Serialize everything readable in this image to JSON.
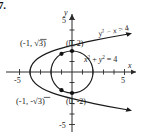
{
  "problem": {
    "number": "7."
  },
  "figure": {
    "axes": {
      "x_axis_label": "x",
      "y_axis_label": "y",
      "x_ticks": [
        {
          "value": -5,
          "label": "-5"
        },
        {
          "value": -4,
          "label": ""
        },
        {
          "value": -3,
          "label": ""
        },
        {
          "value": -2,
          "label": ""
        },
        {
          "value": -1,
          "label": ""
        },
        {
          "value": 1,
          "label": ""
        },
        {
          "value": 2,
          "label": ""
        },
        {
          "value": 3,
          "label": ""
        },
        {
          "value": 4,
          "label": ""
        },
        {
          "value": 5,
          "label": "5"
        }
      ],
      "y_ticks": [
        {
          "value": 5,
          "label": "5"
        },
        {
          "value": 4,
          "label": ""
        },
        {
          "value": 3,
          "label": ""
        },
        {
          "value": 2,
          "label": ""
        },
        {
          "value": 1,
          "label": ""
        },
        {
          "value": -1,
          "label": ""
        },
        {
          "value": -2,
          "label": ""
        },
        {
          "value": -3,
          "label": ""
        },
        {
          "value": -4,
          "label": ""
        },
        {
          "value": -5,
          "label": "-5"
        }
      ],
      "xlim": [
        -6,
        6
      ],
      "ylim": [
        -6,
        6
      ]
    },
    "curves": [
      {
        "name": "parabola",
        "equation_parts": {
          "base1": "y",
          "exp1": "2",
          "mid": " − ",
          "base2": "x",
          "tail": " = 4"
        },
        "equation_text": "y² − x = 4",
        "vertex": [
          -4,
          0
        ],
        "opens": "right",
        "arrowheads": 2
      },
      {
        "name": "circle",
        "equation_parts": {
          "base1": "x",
          "exp1": "2",
          "mid": " + ",
          "base2": "y",
          "exp2": "2",
          "tail": " = 4"
        },
        "equation_text": "x² + y² = 4",
        "center": [
          0,
          0
        ],
        "radius": 2
      }
    ],
    "points": [
      {
        "name": "upper-intersection",
        "label": "(-1, √3)",
        "x": -1,
        "y": 1.732,
        "marked": true
      },
      {
        "name": "lower-intersection",
        "label": "(-1, -√3)",
        "x": -1,
        "y": -1.732,
        "marked": true
      },
      {
        "name": "top-point",
        "label": "(0, 2)",
        "x": 0,
        "y": 2,
        "marked": true
      },
      {
        "name": "bottom-point",
        "label": "(0, -2)",
        "x": 0,
        "y": -2,
        "marked": true
      }
    ],
    "point_label_parts": {
      "upper": {
        "open": "(",
        "x": "-1, ",
        "radical": "√",
        "radicand": "3",
        "close": ")"
      },
      "lower": {
        "open": "(",
        "x": "-1, ",
        "minus": "-",
        "radical": "√",
        "radicand": "3",
        "close": ")"
      },
      "top": "(0, 2)",
      "bottom": "(0, -2)"
    }
  },
  "colors": {
    "ink": "#1a1a1a",
    "axis": "#2a2a2a",
    "background": "#ffffff"
  }
}
